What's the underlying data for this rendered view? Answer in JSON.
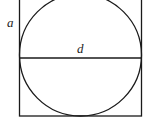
{
  "diagram": {
    "type": "circle inscribed in square",
    "labels": {
      "side": "a",
      "diameter": "d"
    },
    "colors": {
      "stroke": "#1a1a1a",
      "background": "#ffffff"
    }
  }
}
